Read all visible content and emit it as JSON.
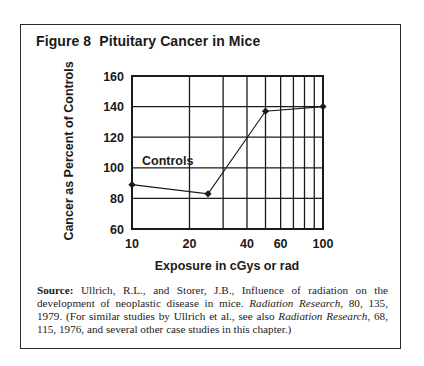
{
  "figure": {
    "title": "Figure 8  Pituitary Cancer in Mice"
  },
  "chart_data": {
    "type": "line",
    "title": "Figure 8  Pituitary Cancer in Mice",
    "xlabel": "Exposure in cGys or rad",
    "ylabel": "Cancer as Percent of Controls",
    "xscale": "log",
    "xlim": [
      10,
      100
    ],
    "ylim": [
      60,
      160
    ],
    "x_ticks": [
      10,
      20,
      40,
      60,
      100
    ],
    "x_tick_labels": [
      "10",
      "20",
      "40",
      "60",
      "100"
    ],
    "x_gridlines": [
      10,
      20,
      30,
      40,
      50,
      60,
      70,
      80,
      90,
      100
    ],
    "y_ticks": [
      60,
      80,
      100,
      120,
      140,
      160
    ],
    "y_tick_labels": [
      "60",
      "80",
      "100",
      "120",
      "140",
      "160"
    ],
    "grid": true,
    "legend": null,
    "annotations": [
      {
        "text": "Controls",
        "x": 10.5,
        "y": 101
      }
    ],
    "series": [
      {
        "name": "Pituitary cancer",
        "x": [
          10,
          25,
          50,
          100
        ],
        "y": [
          89,
          83,
          137,
          140
        ],
        "marker": "diamond",
        "color": "#1a1a1a"
      }
    ]
  },
  "source": {
    "label": "Source:",
    "part1": " Ullrich, R.L., and Storer, J.B., Influence of radiation on the development of neoplastic disease in mice. ",
    "journal1": "Radiation Research",
    "part2": ", 80, 135, 1979. (For similar studies by Ullrich et al., see also ",
    "journal2": "Radiation Research",
    "part3": ", 68, 115, 1976, and several other case studies in this chapter.)"
  },
  "colors": {
    "ink": "#1a1a1a",
    "grid": "#1a1a1a",
    "background": "#ffffff"
  }
}
